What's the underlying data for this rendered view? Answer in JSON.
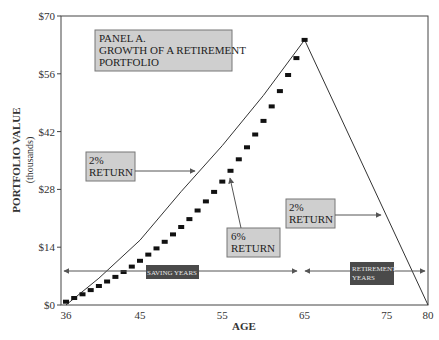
{
  "chart_data": {
    "type": "line",
    "title": "PANEL A. GROWTH OF A RETIREMENT PORTFOLIO",
    "xlabel": "AGE",
    "ylabel": "PORTFOLIO VALUE",
    "ylabel_sub": "(thousands)",
    "xlim": [
      36,
      80
    ],
    "ylim": [
      0,
      70
    ],
    "grid": false,
    "legend": "none",
    "x_ticks": [
      36,
      45,
      55,
      65,
      75,
      80
    ],
    "x_tick_labels": [
      "36",
      "45",
      "55",
      "65",
      "75",
      "80"
    ],
    "y_ticks": [
      0,
      14,
      28,
      42,
      56,
      70
    ],
    "y_tick_labels": [
      "$0",
      "$14",
      "$28",
      "$42",
      "$56",
      "$70"
    ],
    "series": [
      {
        "name": "6% return (markers)",
        "style": "square-markers",
        "x": [
          36,
          37,
          38,
          39,
          40,
          41,
          42,
          43,
          44,
          45,
          46,
          47,
          48,
          49,
          50,
          51,
          52,
          53,
          54,
          55,
          56,
          57,
          58,
          59,
          60,
          61,
          62,
          63,
          64,
          65
        ],
        "values": [
          0.8,
          1.7,
          2.6,
          3.6,
          4.6,
          5.7,
          6.8,
          8.0,
          9.3,
          10.7,
          12.2,
          13.7,
          15.3,
          17.1,
          18.9,
          20.8,
          22.9,
          25.1,
          27.4,
          29.9,
          32.5,
          35.3,
          38.2,
          41.3,
          44.6,
          48.1,
          51.8,
          55.7,
          59.8,
          64.2
        ]
      },
      {
        "name": "2% return (line)",
        "style": "solid-line",
        "x": [
          36,
          40,
          45,
          50,
          55,
          60,
          65,
          80
        ],
        "values": [
          0,
          6.5,
          15.7,
          27.5,
          38.6,
          50.8,
          64.2,
          0
        ]
      }
    ],
    "annotations": [
      {
        "id": "panel",
        "lines": [
          "PANEL A.",
          "GROWTH OF A RETIREMENT",
          "PORTFOLIO"
        ]
      },
      {
        "id": "ret2_left",
        "lines": [
          "2%",
          "RETURN"
        ],
        "points_to": "2% line, saving years"
      },
      {
        "id": "ret6",
        "lines": [
          "6%",
          "RETURN"
        ],
        "points_to": "6% markers"
      },
      {
        "id": "ret2_right",
        "lines": [
          "2%",
          "RETURN"
        ],
        "points_to": "2% line, retirement years"
      },
      {
        "id": "saving",
        "lines": [
          "SAVING YEARS"
        ],
        "span": [
          36,
          65
        ]
      },
      {
        "id": "retirement",
        "lines": [
          "RETIREMENT",
          "YEARS"
        ],
        "span": [
          65,
          80
        ]
      }
    ]
  },
  "labels": {
    "panel_line1": "PANEL A.",
    "panel_line2": "GROWTH OF A RETIREMENT",
    "panel_line3": "PORTFOLIO",
    "ret2_left_l1": "2%",
    "ret2_left_l2": "RETURN",
    "ret6_l1": "6%",
    "ret6_l2": "RETURN",
    "ret2_right_l1": "2%",
    "ret2_right_l2": "RETURN",
    "saving_years": "SAVING YEARS",
    "retirement_l1": "RETIREMENT",
    "retirement_l2": "YEARS",
    "xlabel": "AGE",
    "ylabel": "PORTFOLIO VALUE",
    "ylabel_sub": "(thousands)"
  },
  "colors": {
    "frame": "#444444",
    "marker": "#111111",
    "line": "#333333",
    "light_box": "#cfcfcf",
    "dark_box": "#4a4a4a",
    "arrow": "#555555"
  }
}
